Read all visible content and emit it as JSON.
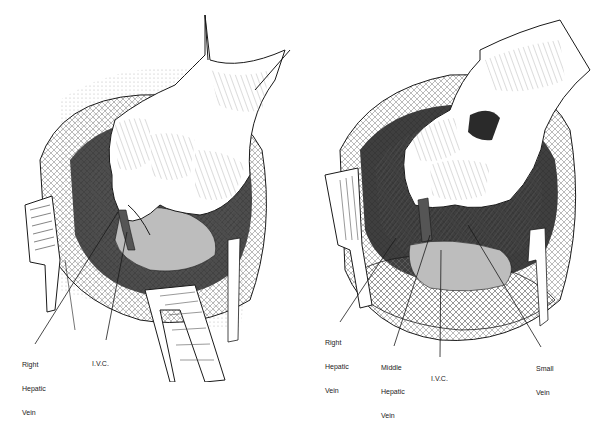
{
  "figure": {
    "panels": [
      {
        "id": "left",
        "labels": [
          {
            "name": "right-hepatic-vein-label",
            "lines": [
              "Right",
              "Hepatic",
              "Vein"
            ],
            "x": 22,
            "y": 345
          },
          {
            "name": "ivc-label",
            "lines": [
              "I.V.C."
            ],
            "x": 92,
            "y": 344
          }
        ]
      },
      {
        "id": "right",
        "labels": [
          {
            "name": "right-hepatic-vein-label",
            "lines": [
              "Right",
              "Hepatic",
              "Vein"
            ],
            "x": 325,
            "y": 323
          },
          {
            "name": "middle-hepatic-vein-label",
            "lines": [
              "Middle",
              "Hepatic",
              "Vein"
            ],
            "x": 381,
            "y": 348
          },
          {
            "name": "ivc-label",
            "lines": [
              "I.V.C."
            ],
            "x": 431,
            "y": 359
          },
          {
            "name": "small-vein-label",
            "lines": [
              "Small",
              "Vein"
            ],
            "x": 536,
            "y": 349
          }
        ]
      }
    ],
    "colors": {
      "ink": "#1a1a1a",
      "background": "#ffffff",
      "shade_dark": "#3a3a3a",
      "shade_mid": "#8a8a8a",
      "shade_light": "#d0d0d0"
    }
  }
}
